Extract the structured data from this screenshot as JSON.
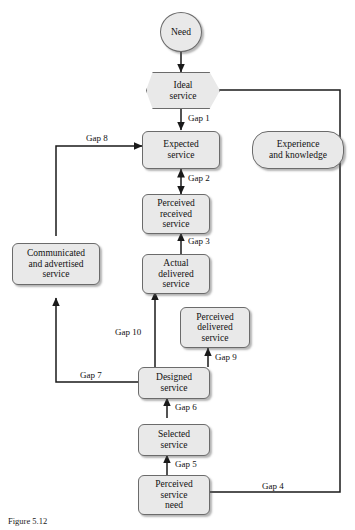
{
  "figure": {
    "caption": "Figure 5.12",
    "background_color": "#ffffff",
    "node_fill_color": "#e9e9e9",
    "node_border_color": "#6b6b6b",
    "line_color": "#1a1a1a",
    "text_color": "#111111"
  },
  "nodes": [
    {
      "id": "need",
      "label": "Need",
      "shape": "ellipse"
    },
    {
      "id": "ideal",
      "label": "Ideal\nservice",
      "shape": "hexagon"
    },
    {
      "id": "expected",
      "label": "Expected\nservice",
      "shape": "rounded"
    },
    {
      "id": "experience",
      "label": "Experience\nand knowledge",
      "shape": "pill"
    },
    {
      "id": "perc_received",
      "label": "Perceived\nreceived\nservice",
      "shape": "rounded"
    },
    {
      "id": "actual",
      "label": "Actual\ndelivered\nservice",
      "shape": "rounded"
    },
    {
      "id": "communicated",
      "label": "Communicated\nand advertised\nservice",
      "shape": "rounded"
    },
    {
      "id": "perc_delivered",
      "label": "Perceived\ndelivered\nservice",
      "shape": "rounded"
    },
    {
      "id": "designed",
      "label": "Designed\nservice",
      "shape": "rounded"
    },
    {
      "id": "selected",
      "label": "Selected\nservice",
      "shape": "rounded"
    },
    {
      "id": "perc_need",
      "label": "Perceived\nservice\nneed",
      "shape": "rounded"
    }
  ],
  "gaps": [
    {
      "id": "gap1",
      "label": "Gap 1",
      "from": "ideal",
      "to": "expected",
      "arrow": "single"
    },
    {
      "id": "gap2",
      "label": "Gap 2",
      "from": "perc_received",
      "to": "expected",
      "arrow": "double"
    },
    {
      "id": "gap3",
      "label": "Gap 3",
      "from": "actual",
      "to": "perc_received",
      "arrow": "single"
    },
    {
      "id": "gap4",
      "label": "Gap 4",
      "from": "ideal",
      "to": "perc_need",
      "arrow": "single"
    },
    {
      "id": "gap5",
      "label": "Gap 5",
      "from": "perc_need",
      "to": "selected",
      "arrow": "single"
    },
    {
      "id": "gap6",
      "label": "Gap 6",
      "from": "selected",
      "to": "designed",
      "arrow": "single"
    },
    {
      "id": "gap7",
      "label": "Gap 7",
      "from": "designed",
      "to": "communicated",
      "arrow": "single"
    },
    {
      "id": "gap8",
      "label": "Gap 8",
      "from": "communicated",
      "to": "expected",
      "arrow": "single"
    },
    {
      "id": "gap9",
      "label": "Gap 9",
      "from": "designed",
      "to": "perc_delivered",
      "arrow": "single"
    },
    {
      "id": "gap10",
      "label": "Gap 10",
      "from": "designed",
      "to": "actual",
      "arrow": "single"
    }
  ]
}
